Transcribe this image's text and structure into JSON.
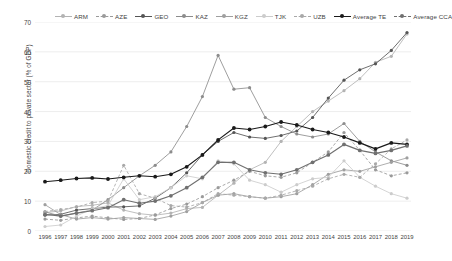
{
  "chart_data": {
    "type": "line",
    "title": "",
    "xlabel": "",
    "ylabel": "Domestic credit to private sector (% of GDP)",
    "ylim": [
      0,
      70
    ],
    "yticks": [
      0,
      10,
      20,
      30,
      40,
      50,
      60,
      70
    ],
    "grid": true,
    "legend_position": "top",
    "categories": [
      1996,
      1997,
      1998,
      1999,
      2000,
      2001,
      2002,
      2003,
      2004,
      2005,
      2006,
      2007,
      2008,
      2009,
      2010,
      2011,
      2012,
      2013,
      2014,
      2015,
      2016,
      2017,
      2018,
      2019
    ],
    "series": [
      {
        "name": "ARM",
        "color": "#b3b3b3",
        "dash": "none",
        "values": [
          6.2,
          6.7,
          8.2,
          8.6,
          9.4,
          7.0,
          5.8,
          5.3,
          6.0,
          7.5,
          7.9,
          12.0,
          16.0,
          20.5,
          23.0,
          30.0,
          35.0,
          40.0,
          43.5,
          47.0,
          51.0,
          56.5,
          58.5,
          66.0
        ]
      },
      {
        "name": "AZE",
        "color": "#9a9a9a",
        "dash": "dashed",
        "values": [
          4.0,
          3.6,
          4.4,
          5.0,
          4.4,
          3.9,
          4.2,
          5.4,
          7.5,
          9.0,
          11.5,
          14.5,
          17.0,
          20.0,
          18.5,
          18.0,
          19.5,
          23.0,
          26.5,
          33.0,
          27.0,
          20.5,
          18.5,
          19.5
        ]
      },
      {
        "name": "GEO",
        "color": "#555555",
        "dash": "none",
        "values": [
          5.3,
          5.6,
          7.0,
          7.5,
          8.0,
          8.1,
          8.4,
          11.0,
          14.5,
          19.5,
          25.5,
          30.0,
          33.0,
          31.5,
          31.0,
          32.0,
          33.5,
          38.0,
          44.5,
          50.5,
          54.0,
          56.0,
          60.5,
          66.5
        ]
      },
      {
        "name": "KAZ",
        "color": "#8c8c8c",
        "dash": "none",
        "values": [
          6.4,
          5.0,
          6.0,
          7.0,
          10.5,
          14.5,
          18.5,
          22.0,
          26.5,
          35.0,
          45.0,
          58.8,
          47.5,
          48.0,
          38.0,
          35.0,
          32.5,
          31.5,
          32.5,
          36.0,
          30.0,
          26.5,
          23.5,
          22.0
        ]
      },
      {
        "name": "KGZ",
        "color": "#9f9f9f",
        "dash": "none",
        "values": [
          8.8,
          5.5,
          4.0,
          4.5,
          4.0,
          4.5,
          4.2,
          3.9,
          5.0,
          6.5,
          9.5,
          12.0,
          12.5,
          11.5,
          11.0,
          11.5,
          12.5,
          15.5,
          19.0,
          20.5,
          20.0,
          21.5,
          23.0,
          24.5
        ]
      },
      {
        "name": "TJK",
        "color": "#cccccc",
        "dash": "none",
        "values": [
          1.5,
          2.0,
          5.0,
          7.5,
          8.5,
          17.5,
          10.5,
          11.5,
          14.5,
          18.5,
          17.5,
          23.5,
          22.5,
          17.0,
          15.5,
          13.0,
          15.5,
          17.5,
          18.0,
          23.5,
          18.0,
          15.0,
          12.5,
          11.0
        ]
      },
      {
        "name": "UZB",
        "color": "#a8a8a8",
        "dash": "dashed",
        "values": [
          6.5,
          7.2,
          8.0,
          9.5,
          10.0,
          22.0,
          12.5,
          11.0,
          8.5,
          8.0,
          9.5,
          12.5,
          12.0,
          11.5,
          11.0,
          12.0,
          13.5,
          15.0,
          17.5,
          19.0,
          18.0,
          22.5,
          27.5,
          30.5
        ]
      },
      {
        "name": "Average TE",
        "color": "#1a1a1a",
        "dash": "none",
        "values": [
          16.5,
          17.0,
          17.6,
          17.8,
          17.4,
          18.0,
          18.5,
          18.2,
          19.0,
          21.5,
          25.5,
          30.5,
          34.5,
          34.0,
          35.0,
          36.5,
          35.5,
          34.0,
          33.0,
          31.5,
          29.5,
          27.5,
          29.5,
          29.0
        ]
      },
      {
        "name": "Average CCA",
        "color": "#707070",
        "dash": "none",
        "values": [
          5.6,
          5.0,
          6.0,
          6.8,
          7.8,
          10.5,
          9.3,
          10.0,
          11.8,
          14.5,
          18.0,
          23.0,
          23.0,
          20.5,
          19.5,
          19.0,
          20.5,
          23.0,
          25.5,
          29.0,
          27.0,
          26.0,
          27.0,
          28.5
        ]
      }
    ]
  },
  "legend": {
    "items": [
      {
        "label": "ARM",
        "color": "#b3b3b3",
        "dash": "none"
      },
      {
        "label": "AZE",
        "color": "#9a9a9a",
        "dash": "dashed"
      },
      {
        "label": "GEO",
        "color": "#555555",
        "dash": "none"
      },
      {
        "label": "KAZ",
        "color": "#8c8c8c",
        "dash": "none"
      },
      {
        "label": "KGZ",
        "color": "#9f9f9f",
        "dash": "none"
      },
      {
        "label": "TJK",
        "color": "#cccccc",
        "dash": "none"
      },
      {
        "label": "UZB",
        "color": "#a8a8a8",
        "dash": "dashed"
      },
      {
        "label": "Average TE",
        "color": "#1a1a1a",
        "dash": "none"
      },
      {
        "label": "Average CCA",
        "color": "#707070",
        "dash": "dashed"
      }
    ]
  },
  "axes": {
    "y_title": "Domestic credit to private sector (% of GDP)",
    "grid_color": "#e8e8e8"
  }
}
